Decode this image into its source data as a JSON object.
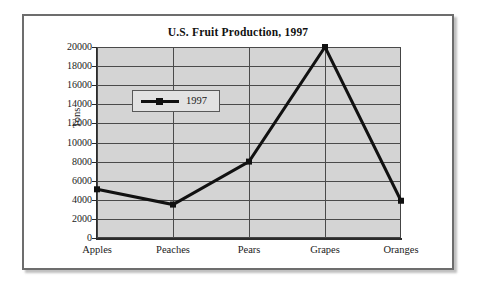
{
  "figure": {
    "title": "U.S. Fruit Production, 1997"
  },
  "chart_data": {
    "type": "line",
    "title": "U.S. Fruit Production, 1997",
    "xlabel": "",
    "ylabel": "Tons",
    "categories": [
      "Apples",
      "Peaches",
      "Pears",
      "Grapes",
      "Oranges"
    ],
    "series": [
      {
        "name": "1997",
        "values": [
          5100,
          3500,
          8000,
          20000,
          3900
        ]
      }
    ],
    "ylim": [
      0,
      20000
    ],
    "ytick_labels": [
      "0",
      "2000",
      "4000",
      "6000",
      "8000",
      "10000",
      "12000",
      "14000",
      "16000",
      "18000",
      "20000"
    ],
    "ytick_values": [
      0,
      2000,
      4000,
      6000,
      8000,
      10000,
      12000,
      14000,
      16000,
      18000,
      20000
    ],
    "grid": true,
    "legend_position": "upper left",
    "legend_entries": [
      "1997"
    ],
    "colors": {
      "line": "#111111",
      "plot_background": "#d4d4d4",
      "gridline": "#4a4a4a",
      "axis": "#2b2b2b",
      "frame": "#6d6d6d",
      "legend_background": "#e2e2e2"
    }
  }
}
